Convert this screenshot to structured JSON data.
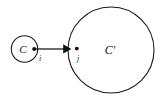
{
  "figure": {
    "kind": "graph-diagram",
    "width": 161,
    "height": 97,
    "background_color": "#ffffff",
    "stroke_color": "#1a1a1a",
    "fill_color": "#111111"
  },
  "clusters": [
    {
      "id": "source-cluster",
      "label": "C",
      "cx": 24.5,
      "cy": 49,
      "r": 13.2,
      "stroke_width": 1.1,
      "label_x": 23,
      "label_y": 49,
      "label_size": 11
    },
    {
      "id": "target-cluster",
      "label": "C′",
      "cx": 111,
      "cy": 50,
      "r": 43,
      "stroke_width": 1.1,
      "label_x": 110,
      "label_y": 50,
      "label_size": 12
    }
  ],
  "nodes": [
    {
      "id": "node-i",
      "label": "i",
      "cx": 34.2,
      "cy": 49,
      "r": 2.0,
      "label_x": 40,
      "label_y": 58.5,
      "label_size": 8
    },
    {
      "id": "node-j",
      "label": "j",
      "cx": 76.8,
      "cy": 48.6,
      "r": 1.9,
      "label_x": 78,
      "label_y": 58.5,
      "label_size": 8
    }
  ],
  "edges": [
    {
      "id": "edge-i-to-j",
      "from": "node-i",
      "to": "node-j",
      "x1": 34.2,
      "y1": 49,
      "x2": 64.5,
      "y2": 49,
      "stroke_width": 1.3,
      "arrowhead_points": "63.2,44.2 71.4,48.9 63.2,53.6",
      "directed": true
    }
  ]
}
